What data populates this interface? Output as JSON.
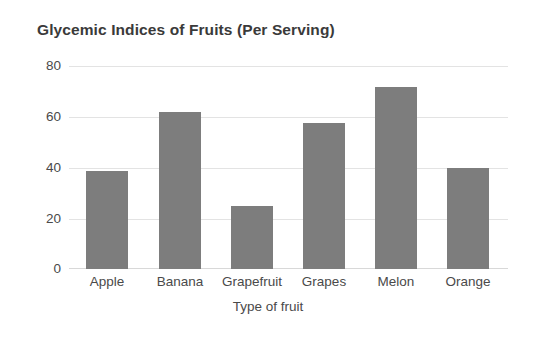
{
  "chart_data": {
    "type": "bar",
    "title": "Glycemic Indices of Fruits (Per Serving)",
    "xlabel": "Type of fruit",
    "ylabel": "",
    "categories": [
      "Apple",
      "Banana",
      "Grapefruit",
      "Grapes",
      "Melon",
      "Orange"
    ],
    "values": [
      39,
      62,
      25,
      58,
      72,
      40
    ],
    "ylim": [
      0,
      80
    ],
    "yticks": [
      0,
      20,
      40,
      60,
      80
    ],
    "ytick_labels": [
      "0",
      "20",
      "40",
      "60",
      "80"
    ],
    "grid": "horizontal",
    "legend": "none",
    "bar_color": "#7d7d7d",
    "gridline_color": "#e3e3e3",
    "title_color": "#3a3a3a",
    "tick_label_color": "#4a4a4a",
    "background_color": "#ffffff"
  }
}
